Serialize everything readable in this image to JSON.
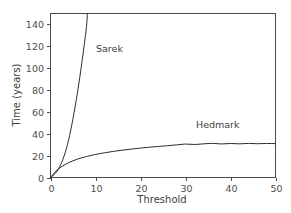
{
  "chart_data": {
    "type": "line",
    "title": "",
    "xlabel": "Threshold",
    "ylabel": "Time (years)",
    "xlim": [
      0,
      50
    ],
    "ylim": [
      0,
      150
    ],
    "grid": false,
    "legend_position": "inline-annotation",
    "xticks": [
      0,
      10,
      20,
      30,
      40,
      50
    ],
    "xtick_labels": [
      "0",
      "10",
      "20",
      "30",
      "40",
      "50"
    ],
    "yticks": [
      0,
      20,
      40,
      60,
      80,
      100,
      120,
      140
    ],
    "ytick_labels": [
      "0",
      "20",
      "40",
      "60",
      "80",
      "100",
      "120",
      "140"
    ],
    "line_color": "#2b2b2b",
    "background_color": "#ffffff",
    "axis_color": "#4a4a4a",
    "series": [
      {
        "name": "Sarek",
        "annotation": "Sarek",
        "note": "steeply rising curve, leaves the top of the plot near threshold 8.2",
        "x": [
          0,
          0.5,
          1,
          1.5,
          2,
          2.5,
          3,
          3.5,
          4,
          4.5,
          5,
          5.5,
          6,
          6.5,
          7,
          7.5,
          8,
          8.2
        ],
        "y": [
          0,
          1.5,
          3.5,
          6,
          9.5,
          14,
          19.5,
          26,
          34,
          43.5,
          54,
          65.5,
          78,
          91.5,
          106,
          121.5,
          138,
          150
        ]
      },
      {
        "name": "Hedmark",
        "annotation": "Hedmark",
        "note": "saturating curve plateauing near 31 years with small ripples",
        "x": [
          0,
          1,
          2,
          3,
          4,
          5,
          6,
          7,
          8,
          9,
          10,
          12,
          14,
          16,
          18,
          20,
          22,
          24,
          26,
          28,
          30,
          32,
          34,
          36,
          38,
          40,
          42,
          44,
          46,
          48,
          50
        ],
        "y": [
          0,
          5.0,
          8.6,
          11.3,
          13.5,
          15.3,
          16.8,
          18.1,
          19.2,
          20.2,
          21.1,
          22.6,
          23.9,
          25.0,
          26.0,
          26.9,
          27.7,
          28.4,
          29.1,
          29.8,
          30.6,
          30.2,
          30.8,
          31.2,
          30.7,
          31.1,
          30.8,
          31.2,
          30.9,
          31.1,
          31.0
        ]
      }
    ]
  },
  "annotations": {
    "sarek_label": "Sarek",
    "hedmark_label": "Hedmark"
  }
}
